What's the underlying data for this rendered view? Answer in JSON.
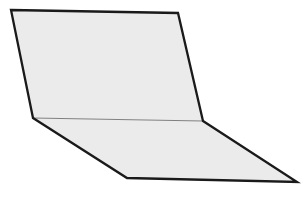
{
  "canvas": {
    "width": 301,
    "height": 201,
    "background_color": "#ffffff"
  },
  "diagram": {
    "fill_color": "#ebebeb",
    "outline_color": "#1a1a1a",
    "outline_width": 2.3,
    "crease_color": "#808080",
    "crease_width": 1.1,
    "vertices": {
      "top_left": [
        11,
        10
      ],
      "top_right": [
        178,
        13
      ],
      "right_fold": [
        203,
        121
      ],
      "far_right_bottom": [
        297,
        182
      ],
      "bottom_middle": [
        127,
        178
      ],
      "left_fold": [
        33,
        118
      ]
    },
    "shapes": [
      {
        "name": "upper-half-plane-face",
        "type": "polygon",
        "attrs": {
          "points": "11,10 178,13 203,121 33,118",
          "fill": "#ebebeb",
          "stroke": "none"
        }
      },
      {
        "name": "lower-half-plane-face",
        "type": "polygon",
        "attrs": {
          "points": "33,118 203,121 297,182 127,178",
          "fill": "#ebebeb",
          "stroke": "none"
        }
      },
      {
        "name": "crease-line",
        "type": "line",
        "attrs": {
          "x1": 33,
          "y1": 118,
          "x2": 203,
          "y2": 121,
          "stroke": "#808080",
          "stroke-width": 1.1,
          "stroke-linecap": "round"
        }
      },
      {
        "name": "sheet-silhouette-outline",
        "type": "polygon",
        "attrs": {
          "points": "11,10 178,13 203,121 297,182 127,178 33,118",
          "fill": "none",
          "stroke": "#1a1a1a",
          "stroke-width": 2.3,
          "stroke-linejoin": "miter",
          "stroke-miterlimit": 6
        }
      }
    ]
  }
}
